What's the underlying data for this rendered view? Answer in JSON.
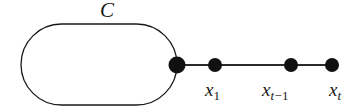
{
  "figure": {
    "type": "graph-diagram",
    "background_color": "#ffffff",
    "stroke_color": "#1a1a1a",
    "node_fill_color": "#111111",
    "cycle": {
      "label": "C",
      "shape": "stadium",
      "label_x": 110,
      "label_y": 12,
      "x": 21,
      "y": 24,
      "width": 156,
      "height": 81,
      "stroke_width": 1.3
    },
    "nodes": [
      {
        "id": "junction",
        "label": "",
        "cx": 177,
        "cy": 65,
        "r": 8.5
      },
      {
        "id": "x1",
        "label": "x",
        "sub": "1",
        "cx": 215,
        "cy": 65,
        "r": 7
      },
      {
        "id": "xt-1",
        "label": "x",
        "sub": "t",
        "sub_extra": "−1",
        "cx": 291,
        "cy": 65,
        "r": 7
      },
      {
        "id": "xt",
        "label": "x",
        "sub": "t",
        "cx": 332,
        "cy": 65,
        "r": 7
      }
    ],
    "edges": [
      {
        "from": "junction",
        "to": "x1",
        "x1": 177,
        "y1": 65,
        "x2": 215,
        "y2": 65
      },
      {
        "from": "x1",
        "to": "xt-1",
        "x1": 215,
        "y1": 65,
        "x2": 291,
        "y2": 65
      },
      {
        "from": "xt-1",
        "to": "xt",
        "x1": 291,
        "y1": 65,
        "x2": 332,
        "y2": 65
      }
    ],
    "labels": {
      "cycle": "C",
      "x1_base": "x",
      "x1_sub": "1",
      "xt_minus_1_base": "x",
      "xt_minus_1_sub": "t",
      "xt_minus_1_sub_minus": "−1",
      "xt_base": "x",
      "xt_sub": "t"
    }
  }
}
